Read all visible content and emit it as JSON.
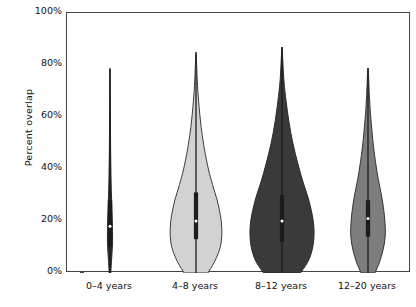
{
  "chart_data": {
    "type": "violin",
    "title": "",
    "xlabel": "",
    "ylabel": "Percent overlap",
    "ylim": [
      0,
      100
    ],
    "yticks": [
      0,
      20,
      40,
      60,
      80,
      100
    ],
    "ytick_labels": [
      "0%",
      "20%",
      "40%",
      "60%",
      "80%",
      "100%"
    ],
    "grid": false,
    "legend": "none",
    "categories": [
      "0–4 years",
      "4–8 years",
      "8–12 years",
      "12–20 years"
    ],
    "series": [
      {
        "name": "0–4 years",
        "fill_color": "#2e2e2e",
        "edge_color": "#2b2b2b",
        "max_width_pct": 3,
        "min": 0,
        "max": 78,
        "median": 18,
        "q1": 10,
        "q3": 28,
        "whisker_low": 0,
        "whisker_high": 78,
        "density": [
          {
            "y": 0,
            "w": 0.3
          },
          {
            "y": 4,
            "w": 0.55
          },
          {
            "y": 8,
            "w": 0.8
          },
          {
            "y": 12,
            "w": 1.0
          },
          {
            "y": 16,
            "w": 0.98
          },
          {
            "y": 20,
            "w": 0.9
          },
          {
            "y": 26,
            "w": 0.72
          },
          {
            "y": 32,
            "w": 0.5
          },
          {
            "y": 40,
            "w": 0.34
          },
          {
            "y": 50,
            "w": 0.22
          },
          {
            "y": 60,
            "w": 0.14
          },
          {
            "y": 70,
            "w": 0.08
          },
          {
            "y": 78,
            "w": 0.03
          }
        ]
      },
      {
        "name": "4–8 years",
        "fill_color": "#d2d2d2",
        "edge_color": "#3c3c3c",
        "max_width_pct": 30,
        "min": 0,
        "max": 84,
        "median": 20,
        "q1": 13,
        "q3": 31,
        "whisker_low": 0,
        "whisker_high": 84,
        "density": [
          {
            "y": 0,
            "w": 0.46
          },
          {
            "y": 4,
            "w": 0.7
          },
          {
            "y": 8,
            "w": 0.88
          },
          {
            "y": 12,
            "w": 0.98
          },
          {
            "y": 17,
            "w": 1.0
          },
          {
            "y": 22,
            "w": 0.95
          },
          {
            "y": 28,
            "w": 0.82
          },
          {
            "y": 34,
            "w": 0.64
          },
          {
            "y": 40,
            "w": 0.48
          },
          {
            "y": 48,
            "w": 0.32
          },
          {
            "y": 56,
            "w": 0.2
          },
          {
            "y": 64,
            "w": 0.12
          },
          {
            "y": 72,
            "w": 0.06
          },
          {
            "y": 84,
            "w": 0.01
          }
        ]
      },
      {
        "name": "8–12 years",
        "fill_color": "#3a3a3a",
        "edge_color": "#2a2a2a",
        "max_width_pct": 37,
        "min": 0,
        "max": 86,
        "median": 20,
        "q1": 12,
        "q3": 30,
        "whisker_low": 0,
        "whisker_high": 86,
        "density": [
          {
            "y": 0,
            "w": 0.58
          },
          {
            "y": 4,
            "w": 0.8
          },
          {
            "y": 8,
            "w": 0.93
          },
          {
            "y": 13,
            "w": 1.0
          },
          {
            "y": 18,
            "w": 1.0
          },
          {
            "y": 23,
            "w": 0.94
          },
          {
            "y": 29,
            "w": 0.82
          },
          {
            "y": 35,
            "w": 0.66
          },
          {
            "y": 42,
            "w": 0.5
          },
          {
            "y": 50,
            "w": 0.34
          },
          {
            "y": 58,
            "w": 0.22
          },
          {
            "y": 66,
            "w": 0.13
          },
          {
            "y": 74,
            "w": 0.06
          },
          {
            "y": 86,
            "w": 0.01
          }
        ]
      },
      {
        "name": "12–20 years",
        "fill_color": "#7d7d7d",
        "edge_color": "#333333",
        "max_width_pct": 20,
        "min": 0,
        "max": 78,
        "median": 21,
        "q1": 14,
        "q3": 28,
        "whisker_low": 0,
        "whisker_high": 78,
        "density": [
          {
            "y": 0,
            "w": 0.4
          },
          {
            "y": 4,
            "w": 0.66
          },
          {
            "y": 9,
            "w": 0.88
          },
          {
            "y": 14,
            "w": 1.0
          },
          {
            "y": 19,
            "w": 0.99
          },
          {
            "y": 24,
            "w": 0.92
          },
          {
            "y": 30,
            "w": 0.78
          },
          {
            "y": 36,
            "w": 0.6
          },
          {
            "y": 43,
            "w": 0.43
          },
          {
            "y": 51,
            "w": 0.28
          },
          {
            "y": 59,
            "w": 0.17
          },
          {
            "y": 67,
            "w": 0.09
          },
          {
            "y": 78,
            "w": 0.02
          }
        ]
      }
    ]
  },
  "axes": {
    "frame_color": "#444444",
    "text_color": "#111111"
  }
}
